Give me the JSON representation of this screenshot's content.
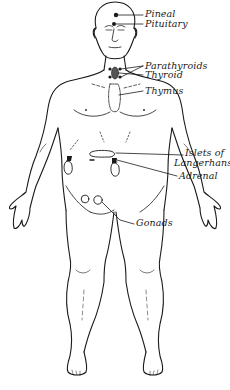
{
  "diagram": {
    "labels": [
      {
        "id": "pineal",
        "text": "Pineal"
      },
      {
        "id": "pituitary",
        "text": "Pituitary"
      },
      {
        "id": "parathyroids",
        "text": "Parathyroids"
      },
      {
        "id": "thyroid",
        "text": "Thyroid"
      },
      {
        "id": "thymus",
        "text": "Thymus"
      },
      {
        "id": "islets_line1",
        "text": "Islets of"
      },
      {
        "id": "islets_line2",
        "text": "Langerhans"
      },
      {
        "id": "adrenal",
        "text": "Adrenal"
      },
      {
        "id": "gonads",
        "text": "Gonads"
      }
    ],
    "colors": {
      "ink": "#1a1a1a",
      "background": "#ffffff"
    }
  }
}
